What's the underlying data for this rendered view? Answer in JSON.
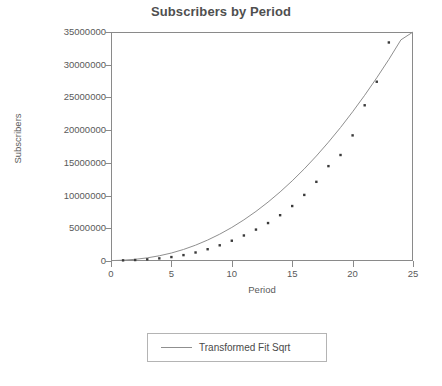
{
  "chart_data": {
    "type": "scatter",
    "title": "Subscribers by Period",
    "xlabel": "Period",
    "ylabel": "Subscribers",
    "xlim": [
      0,
      25
    ],
    "ylim": [
      0,
      35000000
    ],
    "xticks": [
      0,
      5,
      10,
      15,
      20,
      25
    ],
    "yticks": [
      0,
      5000000,
      10000000,
      15000000,
      20000000,
      25000000,
      30000000,
      35000000
    ],
    "ytick_labels": [
      "0",
      "5000000",
      "10000000",
      "15000000",
      "20000000",
      "25000000",
      "30000000",
      "35000000"
    ],
    "xtick_labels": [
      "0",
      "5",
      "10",
      "15",
      "20",
      "25"
    ],
    "grid": false,
    "legend_position": "below-plot",
    "series": [
      {
        "name": "Subscribers",
        "type": "scatter",
        "marker": "square",
        "color": "#3a3a3a",
        "x": [
          1,
          2,
          3,
          4,
          5,
          6,
          7,
          8,
          9,
          10,
          11,
          12,
          13,
          14,
          15,
          16,
          17,
          18,
          19,
          20,
          21,
          22,
          23
        ],
        "y": [
          100000,
          150000,
          250000,
          400000,
          600000,
          900000,
          1300000,
          1800000,
          2400000,
          3100000,
          3900000,
          4800000,
          5800000,
          7000000,
          8400000,
          10100000,
          12100000,
          14500000,
          16200000,
          19200000,
          23800000,
          27400000,
          33400000
        ]
      },
      {
        "name": "Transformed Fit Sqrt",
        "type": "line",
        "color": "#8f8f8f",
        "x": [
          0,
          1,
          2,
          3,
          4,
          5,
          6,
          7,
          8,
          9,
          10,
          11,
          12,
          13,
          14,
          15,
          16,
          17,
          18,
          19,
          20,
          21,
          22,
          23,
          24,
          25
        ],
        "y": [
          60000,
          120000,
          260000,
          480000,
          800000,
          1220000,
          1760000,
          2420000,
          3200000,
          4100000,
          5130000,
          6290000,
          7580000,
          9000000,
          10560000,
          12250000,
          14080000,
          16050000,
          18160000,
          20400000,
          22800000,
          25330000,
          28000000,
          30800000,
          33800000,
          36950000
        ]
      }
    ]
  },
  "legend": {
    "entries": [
      {
        "label": "Transformed Fit Sqrt",
        "swatch": "line-swatch",
        "color": "#8f8f8f"
      }
    ]
  }
}
